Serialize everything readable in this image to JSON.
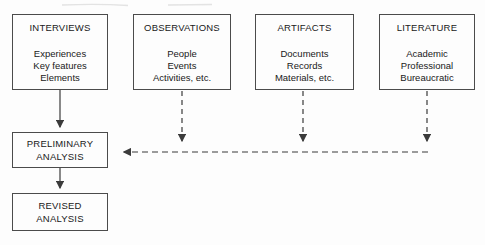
{
  "diagram_title": "data-sources-to-analysis-flow",
  "colors": {
    "background": "#fdfdfd",
    "box_border": "#4b4b4b",
    "line": "#3b3b3b",
    "text": "#202020",
    "scan_artifact": "#dcdcdc"
  },
  "source_boxes": [
    {
      "id": "interviews",
      "title": "INTERVIEWS",
      "items": [
        "Experiences",
        "Key features",
        "Elements"
      ],
      "connector_style": "solid"
    },
    {
      "id": "observations",
      "title": "OBSERVATIONS",
      "items": [
        "People",
        "Events",
        "Activities, etc."
      ],
      "connector_style": "dashed"
    },
    {
      "id": "artifacts",
      "title": "ARTIFACTS",
      "items": [
        "Documents",
        "Records",
        "Materials, etc."
      ],
      "connector_style": "dashed"
    },
    {
      "id": "literature",
      "title": "LITERATURE",
      "items": [
        "Academic",
        "Professional",
        "Bureaucratic"
      ],
      "connector_style": "dashed"
    }
  ],
  "analysis_boxes": [
    {
      "id": "preliminary-analysis",
      "lines": [
        "PRELIMINARY",
        "ANALYSIS"
      ]
    },
    {
      "id": "revised-analysis",
      "lines": [
        "REVISED",
        "ANALYSIS"
      ]
    }
  ]
}
